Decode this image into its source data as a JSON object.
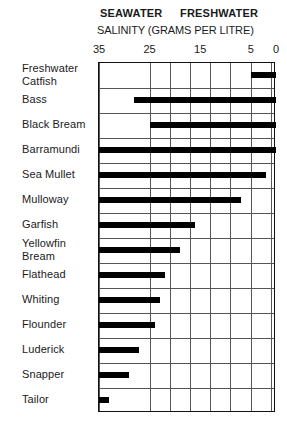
{
  "header": {
    "seawater_label": "SEAWATER",
    "freshwater_label": "FRESHWATER",
    "axis_title": "SALINITY (GRAMS PER LITRE)"
  },
  "chart_data": {
    "type": "bar",
    "orientation": "horizontal",
    "title": "SALINITY (GRAMS PER LITRE)",
    "subtitle": "SEAWATER   FRESHWATER",
    "xlabel": "SALINITY (GRAMS PER LITRE)",
    "ylabel": "",
    "xlim": [
      35,
      0
    ],
    "x_axis_reversed": true,
    "tick_values": [
      35,
      25,
      15,
      5,
      0
    ],
    "tick_labels": [
      "35",
      "25",
      "15",
      "5",
      "0"
    ],
    "gridlines": [
      35,
      25,
      21,
      17,
      13,
      9,
      5,
      1
    ],
    "grid": true,
    "legend": "none",
    "value_unit": "grams per litre",
    "note": "Each bar spans the salinity range tolerated by the species, from seawater (35 g/L, left) to freshwater (0 g/L, right).",
    "categories": [
      "Freshwater Catfish",
      "Bass",
      "Black Bream",
      "Barramundi",
      "Sea Mullet",
      "Mulloway",
      "Garfish",
      "Yellowfin Bream",
      "Flathead",
      "Whiting",
      "Flounder",
      "Luderick",
      "Snapper",
      "Tailor"
    ],
    "category_label_lines": [
      [
        "Freshwater",
        "Catfish"
      ],
      [
        "Bass"
      ],
      [
        "Black Bream"
      ],
      [
        "Barramundi"
      ],
      [
        "Sea Mullet"
      ],
      [
        "Mulloway"
      ],
      [
        "Garfish"
      ],
      [
        "Yellowfin",
        "Bream"
      ],
      [
        "Flathead"
      ],
      [
        "Whiting"
      ],
      [
        "Flounder"
      ],
      [
        "Luderick"
      ],
      [
        "Snapper"
      ],
      [
        "Tailor"
      ]
    ],
    "ranges": [
      {
        "name": "Freshwater Catfish",
        "min": 0,
        "max": 5
      },
      {
        "name": "Bass",
        "min": 0,
        "max": 28
      },
      {
        "name": "Black Bream",
        "min": 0,
        "max": 25
      },
      {
        "name": "Barramundi",
        "min": 0,
        "max": 35
      },
      {
        "name": "Sea Mullet",
        "min": 2,
        "max": 35
      },
      {
        "name": "Mulloway",
        "min": 7,
        "max": 35
      },
      {
        "name": "Garfish",
        "min": 16,
        "max": 35
      },
      {
        "name": "Yellowfin Bream",
        "min": 19,
        "max": 35
      },
      {
        "name": "Flathead",
        "min": 22,
        "max": 35
      },
      {
        "name": "Whiting",
        "min": 23,
        "max": 35
      },
      {
        "name": "Flounder",
        "min": 24,
        "max": 35
      },
      {
        "name": "Luderick",
        "min": 27,
        "max": 35
      },
      {
        "name": "Snapper",
        "min": 29,
        "max": 35
      },
      {
        "name": "Tailor",
        "min": 33,
        "max": 35
      }
    ]
  },
  "colors": {
    "bar": "#000000",
    "grid": "#555555",
    "border": "#111111",
    "text": "#1a1a1a",
    "background": "#ffffff"
  }
}
